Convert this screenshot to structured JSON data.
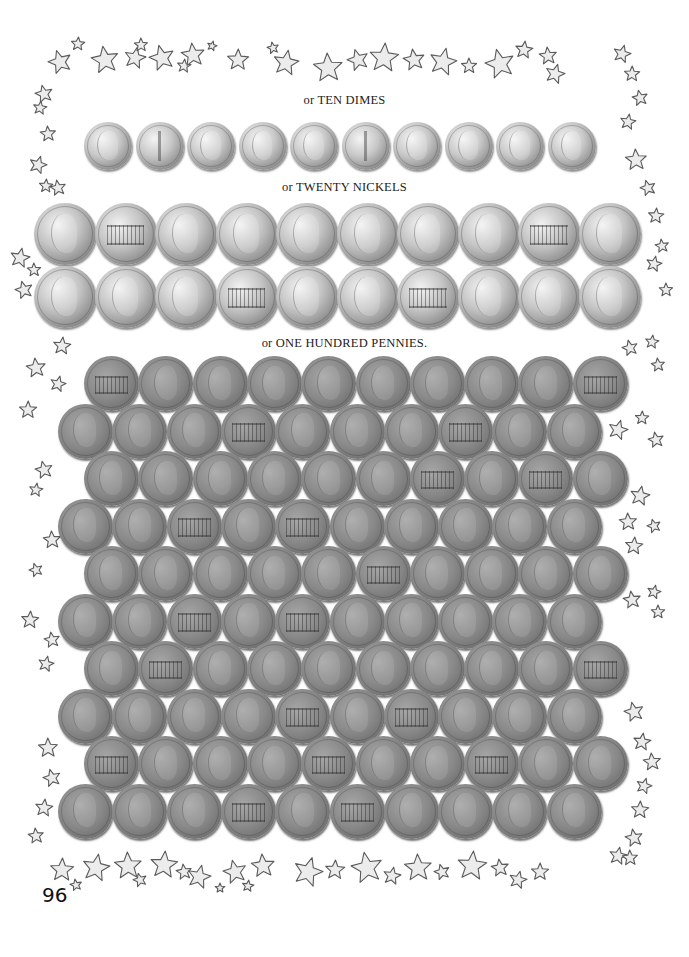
{
  "page": {
    "page_number": "96",
    "background": "#ffffff"
  },
  "captions": {
    "dimes": "or TEN DIMES",
    "nickels": "or TWENTY NICKELS",
    "pennies": "or ONE HUNDRED PENNIES."
  },
  "coins": {
    "dimes": {
      "count": 10,
      "rows": [
        [
          "heads",
          "tails",
          "heads",
          "heads",
          "heads",
          "tails",
          "heads",
          "heads",
          "heads",
          "heads"
        ]
      ]
    },
    "nickels": {
      "count": 20,
      "rows": [
        [
          "heads",
          "tails",
          "heads",
          "heads",
          "heads",
          "heads",
          "heads",
          "heads",
          "tails",
          "heads"
        ],
        [
          "heads",
          "heads",
          "heads",
          "tails",
          "heads",
          "heads",
          "tails",
          "heads",
          "heads",
          "heads"
        ]
      ]
    },
    "pennies": {
      "count": 100,
      "rows": [
        [
          "tails",
          "heads",
          "heads",
          "heads",
          "heads",
          "heads",
          "heads",
          "heads",
          "heads",
          "tails"
        ],
        [
          "heads",
          "heads",
          "heads",
          "tails",
          "heads",
          "heads",
          "heads",
          "tails",
          "heads",
          "heads"
        ],
        [
          "heads",
          "heads",
          "heads",
          "heads",
          "heads",
          "heads",
          "tails",
          "heads",
          "tails",
          "heads"
        ],
        [
          "heads",
          "heads",
          "tails",
          "heads",
          "tails",
          "heads",
          "heads",
          "heads",
          "heads",
          "heads"
        ],
        [
          "heads",
          "heads",
          "heads",
          "heads",
          "heads",
          "tails",
          "heads",
          "heads",
          "heads",
          "heads"
        ],
        [
          "heads",
          "heads",
          "tails",
          "heads",
          "tails",
          "heads",
          "heads",
          "heads",
          "heads",
          "heads"
        ],
        [
          "heads",
          "tails",
          "heads",
          "heads",
          "heads",
          "heads",
          "heads",
          "heads",
          "heads",
          "tails"
        ],
        [
          "heads",
          "heads",
          "heads",
          "heads",
          "tails",
          "heads",
          "tails",
          "heads",
          "heads",
          "heads"
        ],
        [
          "tails",
          "heads",
          "heads",
          "heads",
          "tails",
          "heads",
          "heads",
          "tails",
          "heads",
          "heads"
        ],
        [
          "heads",
          "heads",
          "heads",
          "tails",
          "heads",
          "tails",
          "heads",
          "heads",
          "heads",
          "heads"
        ]
      ]
    }
  },
  "decoration": {
    "border_icon": "star-icon",
    "border_fill": "#ececec",
    "border_stroke": "#5a5a5a"
  }
}
